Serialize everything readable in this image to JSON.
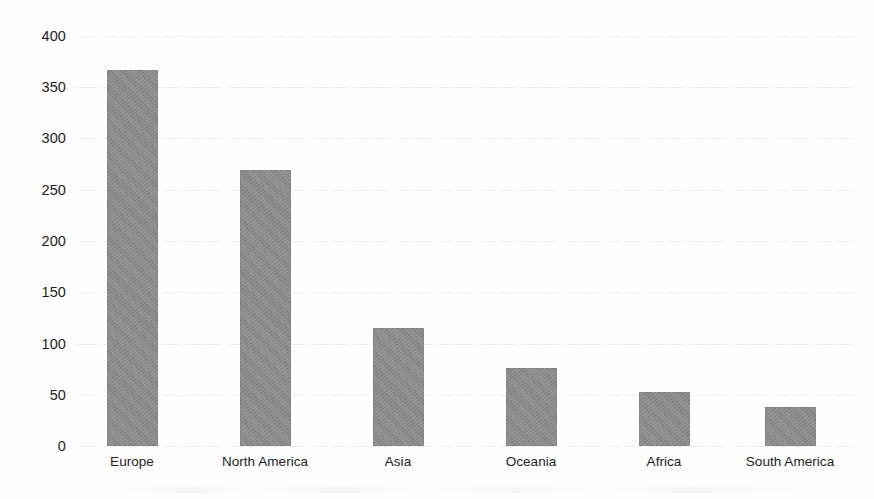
{
  "chart_data": {
    "type": "bar",
    "title": "",
    "subtitle": "",
    "xlabel": "",
    "ylabel": "",
    "categories": [
      "Europe",
      "North America",
      "Asia",
      "Oceania",
      "Africa",
      "South America"
    ],
    "values": [
      367,
      269,
      115,
      76,
      53,
      38
    ],
    "ylim": [
      0,
      400
    ],
    "yticks": [
      0,
      50,
      100,
      150,
      200,
      250,
      300,
      350,
      400
    ],
    "ytick_labels": [
      "0",
      "50",
      "100",
      "150",
      "200",
      "250",
      "300",
      "350",
      "400"
    ],
    "grid": true,
    "grid_axis": "y",
    "legend": false,
    "legend_position": "none",
    "bar_color": "#8b8b8b",
    "grid_color": "#e9e9e9",
    "text_color": "#1d1d1d",
    "background_color": "#ffffff",
    "annotations": []
  },
  "axis": {
    "y_ticks": [
      "400",
      "350",
      "300",
      "250",
      "200",
      "150",
      "100",
      "50",
      "0"
    ],
    "x_categories": [
      "Europe",
      "North America",
      "Asia",
      "Oceania",
      "Africa",
      "South America"
    ]
  }
}
